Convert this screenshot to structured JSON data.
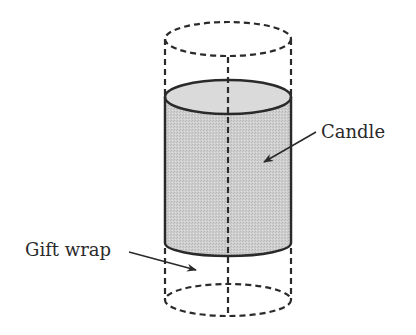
{
  "diagram": {
    "type": "cylinder-illustration",
    "labels": {
      "candle": "Candle",
      "gift_wrap": "Gift wrap"
    },
    "colors": {
      "stroke": "#2a2a2a",
      "candle_fill": "#c9c9c9",
      "candle_top_fill": "#d6d6d6",
      "background": "#ffffff"
    },
    "shapes": {
      "gift_wrap_cylinder": {
        "style": "dashed",
        "cx": 228,
        "rx": 63,
        "top_cy": 39,
        "bottom_cy": 300,
        "ry": 17
      },
      "candle_cylinder": {
        "style": "solid",
        "cx": 228,
        "rx": 63,
        "top_cy": 97,
        "bottom_cy": 243,
        "ry": 17
      },
      "center_axis": {
        "style": "dashed",
        "x": 228
      }
    }
  }
}
